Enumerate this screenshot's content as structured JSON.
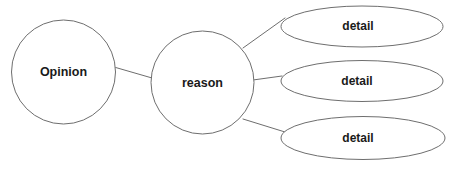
{
  "diagram": {
    "type": "concept-web",
    "background_color": "#ffffff",
    "stroke_color": "#6e6e6e",
    "text_color": "#1a1a1a",
    "nodes": {
      "opinion": {
        "label": "Opinion",
        "shape": "circle",
        "cx": 63.5,
        "cy": 72,
        "rx": 52,
        "ry": 52
      },
      "reason": {
        "label": "reason",
        "shape": "circle",
        "cx": 202.5,
        "cy": 82.5,
        "rx": 51.5,
        "ry": 51.5
      },
      "detail_1": {
        "label": "detail",
        "shape": "ellipse",
        "cx": 362,
        "cy": 26.5,
        "rx": 81,
        "ry": 20.5
      },
      "detail_2": {
        "label": "detail",
        "shape": "ellipse",
        "cx": 362,
        "cy": 81,
        "rx": 81,
        "ry": 20.5
      },
      "detail_3": {
        "label": "detail",
        "shape": "ellipse",
        "cx": 363,
        "cy": 138,
        "rx": 82,
        "ry": 21.5
      }
    },
    "connectors": [
      {
        "name": "opinion-to-reason",
        "x1": 114,
        "y1": 67,
        "x2": 152,
        "y2": 78
      },
      {
        "name": "reason-to-detail-1",
        "x1": 243,
        "y1": 48,
        "x2": 285,
        "y2": 18
      },
      {
        "name": "reason-to-detail-2",
        "x1": 253,
        "y1": 80,
        "x2": 282,
        "y2": 76
      },
      {
        "name": "reason-to-detail-3",
        "x1": 243,
        "y1": 119,
        "x2": 285,
        "y2": 132
      }
    ]
  }
}
